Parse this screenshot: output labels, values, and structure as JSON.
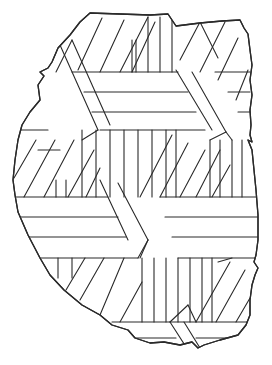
{
  "figure": {
    "colors": {
      "background": "#ffffff",
      "ink": "#2a2a2a"
    },
    "outline_points": "90,13 120,14 150,15 168,14 172,20 176,26 200,23 222,21 240,20 244,28 248,34 250,50 252,65 250,80 252,95 250,110 251,125 250,135 252,142 248,140 252,150 254,170 256,190 258,215 258,240 256,255 254,262 258,268 255,275 252,285 250,300 250,315 246,325 238,335 220,340 204,345 198,348 192,342 180,345 164,342 150,343 135,338 128,330 112,325 100,315 82,305 64,290 50,275 40,258 28,235 18,212 15,195 13,180 15,160 18,140 22,125 30,112 40,100 38,85 44,76 40,72 48,68 52,62 58,48 70,35 80,22 90,13",
    "hatching": {
      "horizontal_bands": [
        {
          "lines": [
            [
              72,
              72,
              178,
              72
            ],
            [
              84,
              92,
              188,
              92
            ],
            [
              92,
              112,
              196,
              112
            ],
            [
              100,
              130,
              205,
              130
            ]
          ]
        },
        {
          "lines": [
            [
              215,
              72,
              250,
              72
            ],
            [
              228,
              92,
              250,
              92
            ],
            [
              238,
              112,
              250,
              112
            ]
          ]
        },
        {
          "lines": [
            [
              14,
              197,
              108,
              197
            ],
            [
              18,
              217,
              118,
              217
            ],
            [
              24,
              237,
              126,
              237
            ],
            [
              40,
              258,
              138,
              258
            ]
          ]
        },
        {
          "lines": [
            [
              160,
              197,
              256,
              197
            ],
            [
              165,
              217,
              258,
              217
            ],
            [
              172,
              237,
              258,
              237
            ],
            [
              178,
              258,
              256,
              258
            ]
          ]
        },
        {
          "lines": [
            [
              38,
              150,
              60,
              150
            ],
            [
              20,
              130,
              48,
              130
            ],
            [
              112,
              322,
              250,
              322
            ],
            [
              128,
              338,
              176,
              338
            ],
            [
              196,
              338,
              240,
              338
            ]
          ]
        }
      ],
      "vertical_groups": [
        {
          "x": [
            148,
            160,
            172
          ],
          "y_top": 17,
          "y_bottom": 72
        },
        {
          "x": [
            132,
            136
          ],
          "y_top": 40,
          "y_bottom": 72
        },
        {
          "x": [
            82,
            96,
            110,
            124,
            138,
            152,
            166,
            176
          ],
          "y_top": 130,
          "y_bottom": 197
        },
        {
          "x": [
            210,
            220,
            232,
            242
          ],
          "y_top": 140,
          "y_bottom": 197
        },
        {
          "x": [
            56,
            66
          ],
          "y_top": 180,
          "y_bottom": 197
        },
        {
          "x": [
            142,
            154,
            166,
            178,
            190,
            202,
            212
          ],
          "y_top": 258,
          "y_bottom": 322
        },
        {
          "x": [
            58,
            72
          ],
          "y_top": 258,
          "y_bottom": 278
        }
      ],
      "diagonal_lines": [
        [
          78,
          70,
          102,
          18
        ],
        [
          100,
          72,
          124,
          20
        ],
        [
          120,
          72,
          148,
          17
        ],
        [
          132,
          72,
          155,
          22
        ],
        [
          56,
          72,
          72,
          40
        ],
        [
          200,
          72,
          225,
          22
        ],
        [
          218,
          80,
          238,
          38
        ],
        [
          236,
          100,
          248,
          70
        ],
        [
          14,
          178,
          36,
          140
        ],
        [
          24,
          197,
          55,
          140
        ],
        [
          44,
          197,
          74,
          140
        ],
        [
          68,
          197,
          94,
          150
        ],
        [
          86,
          197,
          100,
          168
        ],
        [
          140,
          197,
          172,
          135
        ],
        [
          160,
          197,
          188,
          143
        ],
        [
          180,
          197,
          205,
          150
        ],
        [
          196,
          197,
          220,
          150
        ],
        [
          212,
          197,
          230,
          165
        ],
        [
          66,
          290,
          85,
          258
        ],
        [
          80,
          300,
          104,
          258
        ],
        [
          100,
          315,
          124,
          258
        ],
        [
          120,
          322,
          142,
          282
        ],
        [
          196,
          322,
          230,
          262
        ],
        [
          216,
          322,
          245,
          270
        ],
        [
          236,
          322,
          250,
          298
        ],
        [
          218,
          262,
          232,
          258
        ]
      ],
      "cube_edges": [
        [
          60,
          45,
          98,
          130
        ],
        [
          72,
          40,
          110,
          125
        ],
        [
          98,
          130,
          82,
          140
        ],
        [
          176,
          70,
          212,
          130
        ],
        [
          192,
          72,
          226,
          132
        ],
        [
          226,
          132,
          210,
          140
        ],
        [
          226,
          132,
          232,
          140
        ],
        [
          200,
          22,
          180,
          60
        ],
        [
          200,
          22,
          218,
          58
        ],
        [
          100,
          180,
          128,
          240
        ],
        [
          118,
          183,
          148,
          240
        ],
        [
          148,
          240,
          140,
          258
        ],
        [
          138,
          258,
          148,
          240
        ],
        [
          170,
          322,
          188,
          350
        ],
        [
          184,
          322,
          200,
          348
        ],
        [
          188,
          305,
          170,
          322
        ],
        [
          188,
          305,
          196,
          322
        ]
      ]
    }
  }
}
